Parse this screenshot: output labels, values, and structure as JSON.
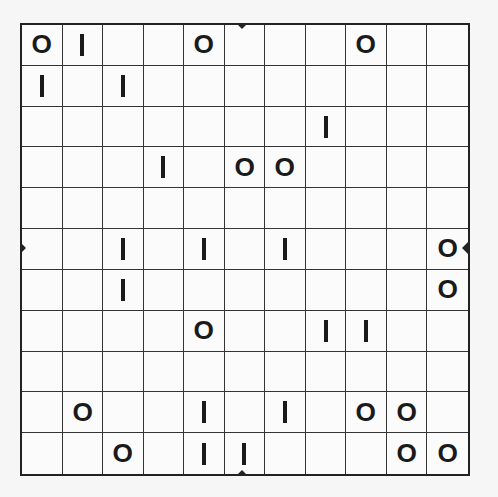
{
  "puzzle": {
    "rows": 11,
    "cols": 11,
    "grid": [
      [
        "O",
        "I",
        "",
        "",
        "O",
        "",
        "",
        "",
        "O",
        "",
        ""
      ],
      [
        "I",
        "",
        "I",
        "",
        "",
        "",
        "",
        "",
        "",
        "",
        ""
      ],
      [
        "",
        "",
        "",
        "",
        "",
        "",
        "",
        "I",
        "",
        "",
        ""
      ],
      [
        "",
        "",
        "",
        "I",
        "",
        "O",
        "O",
        "",
        "",
        "",
        ""
      ],
      [
        "",
        "",
        "",
        "",
        "",
        "",
        "",
        "",
        "",
        "",
        ""
      ],
      [
        "",
        "",
        "I",
        "",
        "I",
        "",
        "I",
        "",
        "",
        "",
        "O"
      ],
      [
        "",
        "",
        "I",
        "",
        "",
        "",
        "",
        "",
        "",
        "",
        "O"
      ],
      [
        "",
        "",
        "",
        "",
        "O",
        "",
        "",
        "I",
        "I",
        "",
        ""
      ],
      [
        "",
        "",
        "",
        "",
        "",
        "",
        "",
        "",
        "",
        "",
        ""
      ],
      [
        "",
        "O",
        "",
        "",
        "I",
        "",
        "I",
        "",
        "O",
        "O",
        ""
      ],
      [
        "",
        "",
        "O",
        "",
        "I",
        "I",
        "",
        "",
        "",
        "O",
        "O"
      ]
    ],
    "markers": [
      "top-center",
      "bottom-center",
      "left-middle",
      "right-middle"
    ]
  }
}
